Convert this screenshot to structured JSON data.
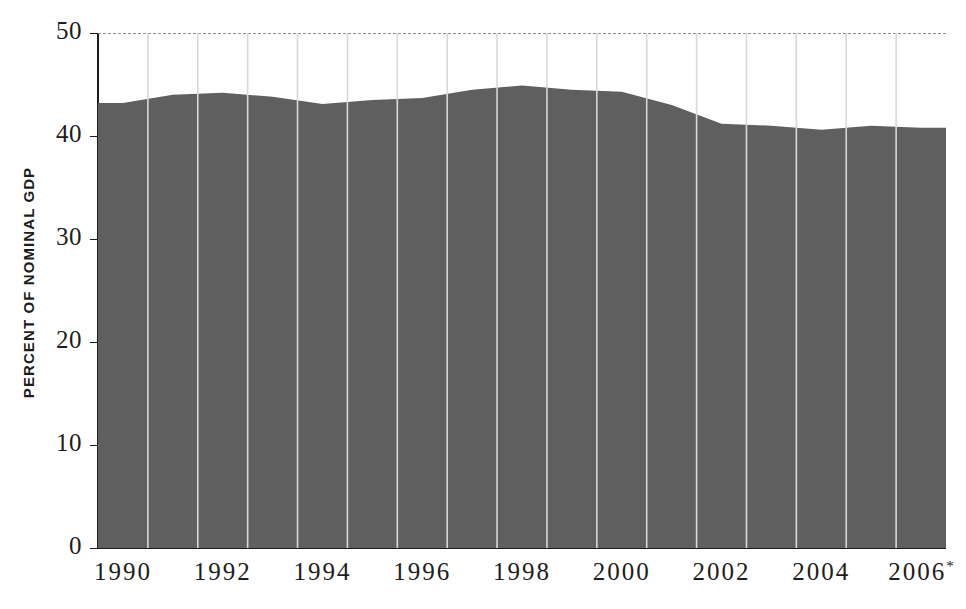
{
  "chart_data": {
    "type": "area",
    "title": "",
    "subtitle": "",
    "xlabel": "",
    "ylabel": "PERCENT OF NOMINAL GDP",
    "ylim": [
      0,
      50
    ],
    "xlim": [
      1990,
      2007
    ],
    "grid": true,
    "legend": null,
    "y_ticks": [
      0,
      10,
      20,
      30,
      40,
      50
    ],
    "y_tick_labels": [
      "0",
      "10",
      "20",
      "30",
      "40",
      "50"
    ],
    "x_ticks": [
      1990,
      1992,
      1994,
      1996,
      1998,
      2000,
      2002,
      2004,
      2006
    ],
    "x_tick_labels": [
      "1990",
      "1992",
      "1994",
      "1996",
      "1998",
      "2000",
      "2002",
      "2004",
      "2006*"
    ],
    "x_tick_footnote_marker": "*",
    "categories": [
      1990,
      1991,
      1992,
      1993,
      1994,
      1995,
      1996,
      1997,
      1998,
      1999,
      2000,
      2001,
      2002,
      2003,
      2004,
      2005,
      2006
    ],
    "values": [
      43.2,
      44.0,
      44.2,
      43.8,
      43.1,
      43.5,
      43.7,
      44.5,
      44.9,
      44.5,
      44.3,
      43.0,
      41.2,
      41.0,
      40.6,
      41.0,
      40.8
    ],
    "series": [
      {
        "name": "Percent of nominal GDP",
        "values": [
          43.2,
          44.0,
          44.2,
          43.8,
          43.1,
          43.5,
          43.7,
          44.5,
          44.9,
          44.5,
          44.3,
          43.0,
          41.2,
          41.0,
          40.6,
          41.0,
          40.8
        ]
      }
    ],
    "column_separators": true,
    "colors": {
      "area_fill": "#5f5f5f",
      "column_separator": "#d8d8d8",
      "gridline": "#8d8d8d",
      "axis": "#1d1d1d",
      "text": "#1d1d1d",
      "background": "#ffffff"
    }
  }
}
